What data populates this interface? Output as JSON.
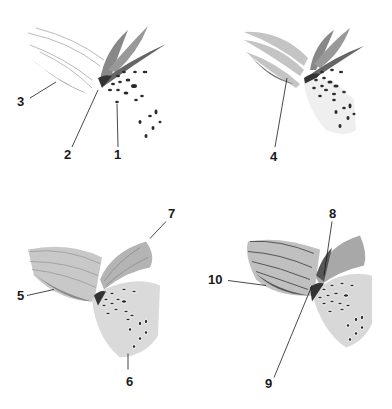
{
  "figure": {
    "ink_color": "#1a1a1a",
    "petal_shade": "#8a8a8a"
  },
  "panels": [
    {
      "step": 1,
      "labels": [
        {
          "id": "1",
          "text": "1"
        },
        {
          "id": "2",
          "text": "2"
        },
        {
          "id": "3",
          "text": "3"
        }
      ]
    },
    {
      "step": 2,
      "labels": [
        {
          "id": "4",
          "text": "4"
        }
      ]
    },
    {
      "step": 3,
      "labels": [
        {
          "id": "5",
          "text": "5"
        },
        {
          "id": "6",
          "text": "6"
        },
        {
          "id": "7",
          "text": "7"
        }
      ]
    },
    {
      "step": 4,
      "labels": [
        {
          "id": "8",
          "text": "8"
        },
        {
          "id": "9",
          "text": "9"
        },
        {
          "id": "10",
          "text": "10"
        }
      ]
    }
  ]
}
